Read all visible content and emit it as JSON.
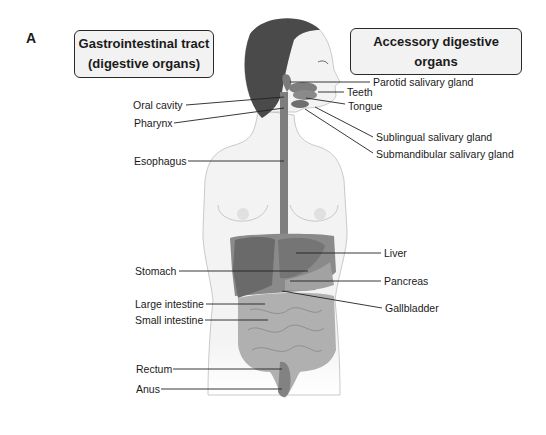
{
  "figure": {
    "panel_letter": "A",
    "groups": {
      "gastrointestinal": {
        "line1": "Gastrointestinal tract",
        "line2": "(digestive organs)"
      },
      "accessory": {
        "title": "Accessory digestive organs"
      }
    },
    "left_labels": [
      {
        "id": "oral-cavity",
        "text": "Oral cavity"
      },
      {
        "id": "pharynx",
        "text": "Pharynx"
      },
      {
        "id": "esophagus",
        "text": "Esophagus"
      },
      {
        "id": "stomach",
        "text": "Stomach"
      },
      {
        "id": "large-intestine",
        "text": "Large intestine"
      },
      {
        "id": "small-intestine",
        "text": "Small intestine"
      },
      {
        "id": "rectum",
        "text": "Rectum"
      },
      {
        "id": "anus",
        "text": "Anus"
      }
    ],
    "right_labels": [
      {
        "id": "parotid",
        "text": "Parotid salivary gland"
      },
      {
        "id": "teeth",
        "text": "Teeth"
      },
      {
        "id": "tongue",
        "text": "Tongue"
      },
      {
        "id": "sublingual",
        "text": "Sublingual salivary gland"
      },
      {
        "id": "submandibular",
        "text": "Submandibular salivary gland"
      },
      {
        "id": "liver",
        "text": "Liver"
      },
      {
        "id": "pancreas",
        "text": "Pancreas"
      },
      {
        "id": "gallbladder",
        "text": "Gallbladder"
      }
    ],
    "colors": {
      "organ_dark": "#6e6e6e",
      "organ_mid": "#8c8c8c",
      "organ_light": "#a8a8a8",
      "hair": "#4a4a4a",
      "skin": "#f3f3f3",
      "outline": "#b0b0b0",
      "leader": "#222222"
    }
  }
}
